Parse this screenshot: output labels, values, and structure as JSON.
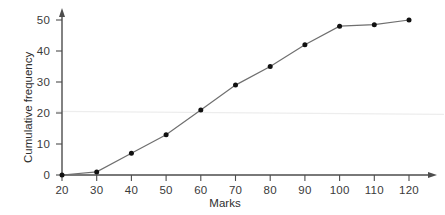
{
  "chart_data": {
    "type": "line",
    "title": "",
    "subtitle": "",
    "xlabel": "Marks",
    "ylabel": "Cumulative frequency",
    "xlim": [
      20,
      125
    ],
    "ylim": [
      0,
      52
    ],
    "xticks": [
      20,
      30,
      40,
      50,
      60,
      70,
      80,
      90,
      100,
      110,
      120
    ],
    "yticks": [
      0,
      10,
      20,
      30,
      40,
      50
    ],
    "grid": false,
    "legend": null,
    "marker": "filled-circle",
    "line_color": "#6f6f6f",
    "marker_color": "#111111",
    "axis_color": "#4d4d4d",
    "x": [
      20,
      30,
      40,
      50,
      60,
      70,
      80,
      90,
      100,
      110,
      120
    ],
    "values": [
      0,
      1,
      7,
      13,
      21,
      29,
      35,
      42,
      48,
      48.5,
      50
    ],
    "points": [
      {
        "x": 20,
        "y": 0
      },
      {
        "x": 30,
        "y": 1
      },
      {
        "x": 40,
        "y": 7
      },
      {
        "x": 50,
        "y": 13
      },
      {
        "x": 60,
        "y": 21
      },
      {
        "x": 70,
        "y": 29
      },
      {
        "x": 80,
        "y": 35
      },
      {
        "x": 90,
        "y": 42
      },
      {
        "x": 100,
        "y": 48
      },
      {
        "x": 110,
        "y": 48.5
      },
      {
        "x": 120,
        "y": 50
      }
    ],
    "annotations": [
      {
        "name": "faint-horizontal-guide",
        "y": 20.5,
        "color": "#ededed"
      }
    ]
  },
  "axis": {
    "x_tick_labels": [
      "20",
      "30",
      "40",
      "50",
      "60",
      "70",
      "80",
      "90",
      "100",
      "110",
      "120"
    ],
    "y_tick_labels": [
      "0",
      "10",
      "20",
      "30",
      "40",
      "50"
    ],
    "x_title": "Marks",
    "y_title": "Cumulative frequency"
  }
}
